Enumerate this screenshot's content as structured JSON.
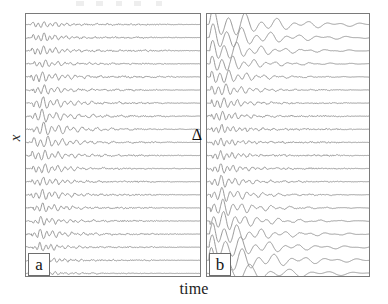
{
  "figure": {
    "axis_y_label": "x",
    "axis_x_label": "time",
    "annotation_delta": "Δ",
    "panel_a_label": "a",
    "panel_b_label": "b",
    "trace_color": "#8c8c8c",
    "border_color": "#7a7a7a",
    "background_color": "#ffffff"
  },
  "chart_data": {
    "type": "line",
    "title": "",
    "subtitle": "",
    "xlabel": "time",
    "ylabel": "x",
    "grid": false,
    "legend": null,
    "annotations": [
      {
        "text": "Δ",
        "panel": "a",
        "x_frac": 0.93,
        "y_frac": 0.44
      },
      {
        "text": "a",
        "panel": "a",
        "x_frac": 0.02,
        "y_frac": 0.93
      },
      {
        "text": "b",
        "panel": "b",
        "x_frac": 0.02,
        "y_frac": 0.93
      }
    ],
    "panels": [
      {
        "id": "a",
        "label": "a",
        "description": "Stacked noisy waveform traces; small-amplitude wavelets confined to the early-time (left) portion, long noisy tails, amplitude roughly uniform down the stack.",
        "n_traces": 20,
        "xlim": [
          0,
          1
        ],
        "ylim": [
          0,
          20
        ],
        "traces": [
          {
            "index": 0,
            "baseline": 0.5,
            "amplitude": 0.34,
            "onset": 0.03,
            "decay": 7.0,
            "freq": 30,
            "noise": 0.085,
            "noise_extent": 0.7,
            "phase": 0.1
          },
          {
            "index": 1,
            "baseline": 1.5,
            "amplitude": 0.4,
            "onset": 0.035,
            "decay": 7.5,
            "freq": 31,
            "noise": 0.09,
            "noise_extent": 0.66,
            "phase": 0.7
          },
          {
            "index": 2,
            "baseline": 2.5,
            "amplitude": 0.44,
            "onset": 0.032,
            "decay": 7.2,
            "freq": 29,
            "noise": 0.092,
            "noise_extent": 0.72,
            "phase": 1.35
          },
          {
            "index": 3,
            "baseline": 3.5,
            "amplitude": 0.38,
            "onset": 0.045,
            "decay": 7.8,
            "freq": 28,
            "noise": 0.086,
            "noise_extent": 0.64,
            "phase": 2.05
          },
          {
            "index": 4,
            "baseline": 4.5,
            "amplitude": 0.5,
            "onset": 0.028,
            "decay": 6.5,
            "freq": 27,
            "noise": 0.095,
            "noise_extent": 0.74,
            "phase": 2.7
          },
          {
            "index": 5,
            "baseline": 5.5,
            "amplitude": 0.46,
            "onset": 0.04,
            "decay": 7.0,
            "freq": 26,
            "noise": 0.088,
            "noise_extent": 0.62,
            "phase": 3.3
          },
          {
            "index": 6,
            "baseline": 6.5,
            "amplitude": 0.55,
            "onset": 0.035,
            "decay": 6.2,
            "freq": 25,
            "noise": 0.09,
            "noise_extent": 0.68,
            "phase": 4.0
          },
          {
            "index": 7,
            "baseline": 7.5,
            "amplitude": 0.6,
            "onset": 0.03,
            "decay": 6.0,
            "freq": 24,
            "noise": 0.094,
            "noise_extent": 0.76,
            "phase": 4.65
          },
          {
            "index": 8,
            "baseline": 8.5,
            "amplitude": 0.64,
            "onset": 0.042,
            "decay": 5.8,
            "freq": 23,
            "noise": 0.082,
            "noise_extent": 0.55,
            "phase": 5.3
          },
          {
            "index": 9,
            "baseline": 9.5,
            "amplitude": 0.58,
            "onset": 0.036,
            "decay": 6.4,
            "freq": 24,
            "noise": 0.09,
            "noise_extent": 0.66,
            "phase": 0.45
          },
          {
            "index": 10,
            "baseline": 10.5,
            "amplitude": 0.52,
            "onset": 0.03,
            "decay": 6.8,
            "freq": 26,
            "noise": 0.092,
            "noise_extent": 0.7,
            "phase": 1.1
          },
          {
            "index": 11,
            "baseline": 11.5,
            "amplitude": 0.48,
            "onset": 0.038,
            "decay": 7.0,
            "freq": 27,
            "noise": 0.086,
            "noise_extent": 0.6,
            "phase": 1.8
          },
          {
            "index": 12,
            "baseline": 12.5,
            "amplitude": 0.44,
            "onset": 0.034,
            "decay": 7.4,
            "freq": 28,
            "noise": 0.09,
            "noise_extent": 0.68,
            "phase": 2.5
          },
          {
            "index": 13,
            "baseline": 13.5,
            "amplitude": 0.5,
            "onset": 0.03,
            "decay": 6.9,
            "freq": 27,
            "noise": 0.093,
            "noise_extent": 0.72,
            "phase": 3.15
          },
          {
            "index": 14,
            "baseline": 14.5,
            "amplitude": 0.46,
            "onset": 0.04,
            "decay": 7.2,
            "freq": 29,
            "noise": 0.088,
            "noise_extent": 0.62,
            "phase": 3.85
          },
          {
            "index": 15,
            "baseline": 15.5,
            "amplitude": 0.42,
            "onset": 0.035,
            "decay": 7.6,
            "freq": 30,
            "noise": 0.09,
            "noise_extent": 0.66,
            "phase": 4.5
          },
          {
            "index": 16,
            "baseline": 16.5,
            "amplitude": 0.48,
            "onset": 0.032,
            "decay": 7.0,
            "freq": 28,
            "noise": 0.092,
            "noise_extent": 0.7,
            "phase": 5.15
          },
          {
            "index": 17,
            "baseline": 17.5,
            "amplitude": 0.4,
            "onset": 0.038,
            "decay": 7.8,
            "freq": 31,
            "noise": 0.086,
            "noise_extent": 0.58,
            "phase": 5.8
          },
          {
            "index": 18,
            "baseline": 18.5,
            "amplitude": 0.36,
            "onset": 0.03,
            "decay": 8.2,
            "freq": 32,
            "noise": 0.084,
            "noise_extent": 0.54,
            "phase": 0.25
          },
          {
            "index": 19,
            "baseline": 19.5,
            "amplitude": 0.26,
            "onset": 0.045,
            "decay": 9.0,
            "freq": 33,
            "noise": 0.06,
            "noise_extent": 0.42,
            "phase": 0.95
          }
        ]
      },
      {
        "id": "b",
        "label": "b",
        "description": "Stacked waveform traces; large smooth damped oscillations at the top and bottom of the stack, noisier lower-amplitude wavelets in the middle rows.",
        "n_traces": 20,
        "xlim": [
          0,
          1
        ],
        "ylim": [
          0,
          20
        ],
        "traces": [
          {
            "index": 0,
            "baseline": 0.5,
            "amplitude": 1.35,
            "onset": 0.01,
            "decay": 3.4,
            "freq": 10,
            "noise": 0.02,
            "noise_extent": 0.35,
            "phase": 0.0
          },
          {
            "index": 1,
            "baseline": 1.5,
            "amplitude": 1.2,
            "onset": 0.014,
            "decay": 3.8,
            "freq": 11,
            "noise": 0.024,
            "noise_extent": 0.4,
            "phase": 0.3
          },
          {
            "index": 2,
            "baseline": 2.5,
            "amplitude": 1.0,
            "onset": 0.018,
            "decay": 4.4,
            "freq": 13,
            "noise": 0.032,
            "noise_extent": 0.48,
            "phase": 0.6
          },
          {
            "index": 3,
            "baseline": 3.5,
            "amplitude": 0.85,
            "onset": 0.02,
            "decay": 5.0,
            "freq": 15,
            "noise": 0.042,
            "noise_extent": 0.55,
            "phase": 0.95
          },
          {
            "index": 4,
            "baseline": 4.5,
            "amplitude": 0.72,
            "onset": 0.022,
            "decay": 5.6,
            "freq": 18,
            "noise": 0.055,
            "noise_extent": 0.62,
            "phase": 1.3
          },
          {
            "index": 5,
            "baseline": 5.5,
            "amplitude": 0.62,
            "onset": 0.024,
            "decay": 6.2,
            "freq": 21,
            "noise": 0.068,
            "noise_extent": 0.68,
            "phase": 1.7
          },
          {
            "index": 6,
            "baseline": 6.5,
            "amplitude": 0.55,
            "onset": 0.026,
            "decay": 6.6,
            "freq": 24,
            "noise": 0.078,
            "noise_extent": 0.72,
            "phase": 2.1
          },
          {
            "index": 7,
            "baseline": 7.5,
            "amplitude": 0.48,
            "onset": 0.026,
            "decay": 7.0,
            "freq": 26,
            "noise": 0.085,
            "noise_extent": 0.76,
            "phase": 2.5
          },
          {
            "index": 8,
            "baseline": 8.5,
            "amplitude": 0.44,
            "onset": 0.028,
            "decay": 7.2,
            "freq": 28,
            "noise": 0.09,
            "noise_extent": 0.78,
            "phase": 2.95
          },
          {
            "index": 9,
            "baseline": 9.5,
            "amplitude": 0.42,
            "onset": 0.028,
            "decay": 7.4,
            "freq": 29,
            "noise": 0.092,
            "noise_extent": 0.8,
            "phase": 3.4
          },
          {
            "index": 10,
            "baseline": 10.5,
            "amplitude": 0.44,
            "onset": 0.027,
            "decay": 7.2,
            "freq": 28,
            "noise": 0.09,
            "noise_extent": 0.78,
            "phase": 3.85
          },
          {
            "index": 11,
            "baseline": 11.5,
            "amplitude": 0.5,
            "onset": 0.026,
            "decay": 6.8,
            "freq": 26,
            "noise": 0.084,
            "noise_extent": 0.74,
            "phase": 4.3
          },
          {
            "index": 12,
            "baseline": 12.5,
            "amplitude": 0.58,
            "onset": 0.024,
            "decay": 6.4,
            "freq": 23,
            "noise": 0.076,
            "noise_extent": 0.7,
            "phase": 4.75
          },
          {
            "index": 13,
            "baseline": 13.5,
            "amplitude": 0.68,
            "onset": 0.022,
            "decay": 5.8,
            "freq": 20,
            "noise": 0.064,
            "noise_extent": 0.64,
            "phase": 5.2
          },
          {
            "index": 14,
            "baseline": 14.5,
            "amplitude": 0.8,
            "onset": 0.02,
            "decay": 5.2,
            "freq": 17,
            "noise": 0.052,
            "noise_extent": 0.58,
            "phase": 5.6
          },
          {
            "index": 15,
            "baseline": 15.5,
            "amplitude": 0.92,
            "onset": 0.018,
            "decay": 4.8,
            "freq": 15,
            "noise": 0.042,
            "noise_extent": 0.52,
            "phase": 6.0
          },
          {
            "index": 16,
            "baseline": 16.5,
            "amplitude": 1.05,
            "onset": 0.016,
            "decay": 4.2,
            "freq": 13,
            "noise": 0.034,
            "noise_extent": 0.46,
            "phase": 0.4
          },
          {
            "index": 17,
            "baseline": 17.5,
            "amplitude": 1.18,
            "onset": 0.014,
            "decay": 3.8,
            "freq": 11,
            "noise": 0.026,
            "noise_extent": 0.4,
            "phase": 0.8
          },
          {
            "index": 18,
            "baseline": 18.5,
            "amplitude": 1.3,
            "onset": 0.012,
            "decay": 3.4,
            "freq": 10,
            "noise": 0.02,
            "noise_extent": 0.34,
            "phase": 1.2
          },
          {
            "index": 19,
            "baseline": 19.5,
            "amplitude": 1.1,
            "onset": 0.016,
            "decay": 3.2,
            "freq": 8,
            "noise": 0.018,
            "noise_extent": 0.3,
            "phase": 1.6
          }
        ]
      }
    ]
  }
}
